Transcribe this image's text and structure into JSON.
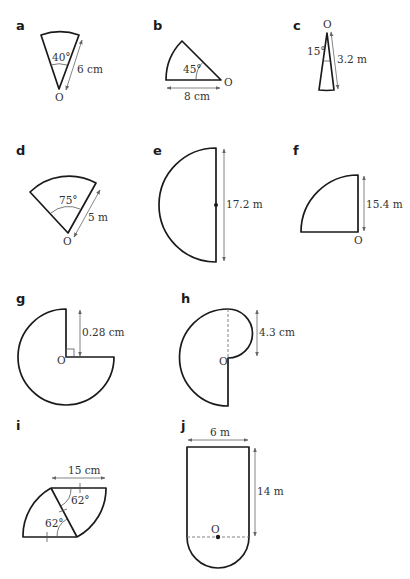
{
  "figures": [
    {
      "label": "a",
      "shape": "sector",
      "angle": "40°",
      "radius": "6 cm",
      "centre": "O"
    },
    {
      "label": "b",
      "shape": "sector",
      "angle": "45°",
      "radius": "8 cm",
      "centre": "O"
    },
    {
      "label": "c",
      "shape": "sector",
      "angle": "15°",
      "radius": "3.2 m",
      "centre": "O"
    },
    {
      "label": "d",
      "shape": "sector",
      "angle": "75°",
      "radius": "5 m",
      "centre": "O"
    },
    {
      "label": "e",
      "shape": "semicircle",
      "diameter": "17.2 m"
    },
    {
      "label": "f",
      "shape": "quarter circle",
      "radius": "15.4 m",
      "centre": "O"
    },
    {
      "label": "g",
      "shape": "three-quarter circle",
      "radius": "0.28 cm",
      "centre": "O"
    },
    {
      "label": "h",
      "shape": "semicircle with small semicircle",
      "small_diameter": "4.3 cm",
      "centre": "O"
    },
    {
      "label": "i",
      "shape": "two sectors",
      "angle_top": "62°",
      "angle_bottom": "62°",
      "radius": "15 cm"
    },
    {
      "label": "j",
      "shape": "rectangle with semicircle",
      "width": "6 m",
      "height": "14 m",
      "centre": "O"
    }
  ],
  "text": {
    "a_label": "a",
    "a_angle": "40°",
    "a_len": "6 cm",
    "a_O": "O",
    "b_label": "b",
    "b_angle": "45°",
    "b_len": "8 cm",
    "b_O": "O",
    "c_label": "c",
    "c_angle": "15°",
    "c_len": "3.2 m",
    "c_O": "O",
    "d_label": "d",
    "d_angle": "75°",
    "d_len": "5 m",
    "d_O": "O",
    "e_label": "e",
    "e_len": "17.2 m",
    "f_label": "f",
    "f_len": "15.4 m",
    "f_O": "O",
    "g_label": "g",
    "g_len": "0.28 cm",
    "g_O": "O",
    "h_label": "h",
    "h_len": "4.3 cm",
    "h_O": "O",
    "i_label": "i",
    "i_len": "15 cm",
    "i_angle1": "62°",
    "i_angle2": "62°",
    "j_label": "j",
    "j_width": "6 m",
    "j_height": "14 m",
    "j_O": "O"
  }
}
